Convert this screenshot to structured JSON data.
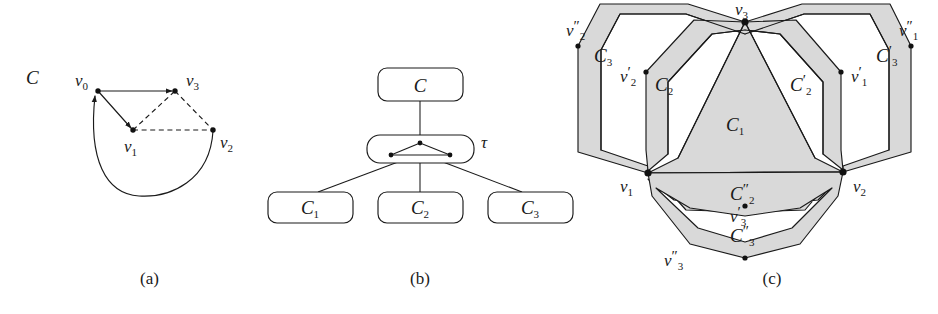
{
  "figure": {
    "colors": {
      "ink": "#1a1a1a",
      "region_fill": "#d9d9d9",
      "page_background": "#ffffff",
      "white_gap": "#ffffff"
    },
    "captions": [
      {
        "key": "a",
        "label": "(a)"
      },
      {
        "key": "b",
        "label": "(b)"
      },
      {
        "key": "c",
        "label": "(c)"
      }
    ]
  },
  "panel_a": {
    "caption": "(a)",
    "graph_label": "C",
    "vertices": [
      {
        "id": "v0",
        "label_base": "v",
        "label_sub": "0",
        "x": 98,
        "y": 91,
        "label_x": 82,
        "label_y": 84
      },
      {
        "id": "v3",
        "label_base": "v",
        "label_sub": "3",
        "x": 175,
        "y": 91,
        "label_x": 186,
        "label_y": 84
      },
      {
        "id": "v1",
        "label_base": "v",
        "label_sub": "1",
        "x": 133,
        "y": 130,
        "label_x": 126,
        "label_y": 152
      },
      {
        "id": "v2",
        "label_base": "v",
        "label_sub": "2",
        "x": 213,
        "y": 130,
        "label_x": 221,
        "label_y": 148
      }
    ],
    "solid_directed_edges": [
      {
        "from": "v0",
        "to": "v3"
      },
      {
        "from": "v0",
        "to": "v1"
      },
      {
        "from": "v2",
        "to": "v0",
        "curved": true
      }
    ],
    "dashed_edges": [
      {
        "from": "v1",
        "to": "v3"
      },
      {
        "from": "v3",
        "to": "v2"
      },
      {
        "from": "v1",
        "to": "v2"
      }
    ]
  },
  "panel_b": {
    "caption": "(b)",
    "root_node": {
      "label": "C"
    },
    "middle_node": {
      "label": "τ",
      "contains": "triangle-graph"
    },
    "leaf_nodes": [
      {
        "label_base": "C",
        "label_sub": "1"
      },
      {
        "label_base": "C",
        "label_sub": "2"
      },
      {
        "label_base": "C",
        "label_sub": "3"
      }
    ]
  },
  "panel_c": {
    "caption": "(c)",
    "region_labels": [
      {
        "id": "C1",
        "base": "C",
        "sub": "1",
        "prime": "",
        "x": 734,
        "y": 126
      },
      {
        "id": "C2",
        "base": "C",
        "sub": "2",
        "prime": "",
        "x": 664,
        "y": 86
      },
      {
        "id": "C2p",
        "base": "C",
        "sub": "2",
        "prime": "′",
        "x": 800,
        "y": 86
      },
      {
        "id": "C3",
        "base": "C",
        "sub": "3",
        "prime": "",
        "x": 604,
        "y": 57
      },
      {
        "id": "C3p",
        "base": "C",
        "sub": "3",
        "prime": "′",
        "x": 888,
        "y": 57
      },
      {
        "id": "C2pp",
        "base": "C",
        "sub": "2",
        "prime": "″",
        "x": 740,
        "y": 196
      },
      {
        "id": "C3pp",
        "base": "C",
        "sub": "3",
        "prime": "″",
        "x": 740,
        "y": 238
      }
    ],
    "vertex_labels": [
      {
        "id": "v3",
        "base": "v",
        "sub": "3",
        "prime": "",
        "x": 743,
        "y": 12,
        "dot_x": 745,
        "dot_y": 22
      },
      {
        "id": "v1",
        "base": "v",
        "sub": "1",
        "prime": "",
        "x": 631,
        "y": 188,
        "dot_x": 648,
        "dot_y": 173
      },
      {
        "id": "v2",
        "base": "v",
        "sub": "2",
        "prime": "",
        "x": 856,
        "y": 188,
        "dot_x": 843,
        "dot_y": 172
      },
      {
        "id": "v2pp",
        "base": "v",
        "sub": "2",
        "prime": "″",
        "x": 574,
        "y": 34,
        "dot_x": 578,
        "dot_y": 46
      },
      {
        "id": "v1pp",
        "base": "v",
        "sub": "1",
        "prime": "″",
        "x": 905,
        "y": 34,
        "dot_x": 911,
        "dot_y": 46
      },
      {
        "id": "v2p",
        "base": "v",
        "sub": "2",
        "prime": "′",
        "x": 628,
        "y": 78,
        "dot_x": 646,
        "dot_y": 72
      },
      {
        "id": "v1p",
        "base": "v",
        "sub": "1",
        "prime": "′",
        "x": 845,
        "y": 78,
        "dot_x": 841,
        "dot_y": 72
      },
      {
        "id": "v3p",
        "base": "v",
        "sub": "3",
        "prime": "′",
        "x": 735,
        "y": 219,
        "dot_x": 745,
        "dot_y": 212
      },
      {
        "id": "v3pp",
        "base": "v",
        "sub": "3",
        "prime": "″",
        "x": 673,
        "y": 262,
        "dot_x": 745,
        "dot_y": 258
      }
    ]
  }
}
